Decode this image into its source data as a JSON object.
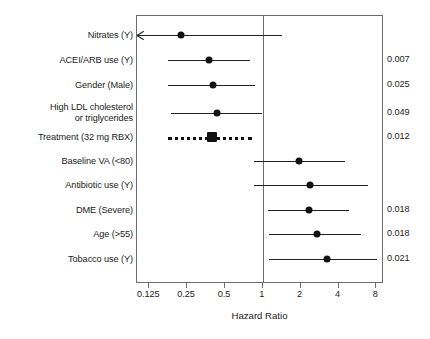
{
  "chart_data": {
    "type": "forest",
    "title": "",
    "xlabel": "Hazard Ratio",
    "ylabel": "",
    "xscale": "log2",
    "xlim": [
      0.1,
      9.2
    ],
    "reference_line": 1,
    "xticks": [
      0.125,
      0.25,
      0.5,
      1,
      2,
      4,
      8
    ],
    "xtick_labels": [
      "0.125",
      "0.25",
      "0.5",
      "1",
      "2",
      "4",
      "8"
    ],
    "pvalue_column_header": "",
    "grid": false,
    "legend": "none",
    "rows": [
      {
        "label": "Nitrates (Y)",
        "hr": 0.23,
        "ci_low": 0.1,
        "ci_high": 1.45,
        "ci_low_truncated": true,
        "marker": "circle",
        "linestyle": "solid",
        "pvalue": ""
      },
      {
        "label": "ACEI/ARB use (Y)",
        "hr": 0.38,
        "ci_low": 0.18,
        "ci_high": 0.8,
        "ci_low_truncated": false,
        "marker": "circle",
        "linestyle": "solid",
        "pvalue": "0.007"
      },
      {
        "label": "Gender (Male)",
        "hr": 0.41,
        "ci_low": 0.18,
        "ci_high": 0.88,
        "ci_low_truncated": false,
        "marker": "circle",
        "linestyle": "solid",
        "pvalue": "0.025"
      },
      {
        "label": "High LDL cholesterol\nor triglycerides",
        "hr": 0.44,
        "ci_low": 0.19,
        "ci_high": 1.0,
        "ci_low_truncated": false,
        "marker": "circle",
        "linestyle": "solid",
        "pvalue": "0.049"
      },
      {
        "label": "Treatment (32 mg RBX)",
        "hr": 0.4,
        "ci_low": 0.18,
        "ci_high": 0.83,
        "ci_low_truncated": false,
        "marker": "square",
        "linestyle": "dotted",
        "pvalue": "0.012"
      },
      {
        "label": "Baseline VA (<80)",
        "hr": 1.97,
        "ci_low": 0.87,
        "ci_high": 4.6,
        "ci_low_truncated": false,
        "marker": "circle",
        "linestyle": "solid",
        "pvalue": ""
      },
      {
        "label": "Antibiotic use (Y)",
        "hr": 2.4,
        "ci_low": 0.87,
        "ci_high": 7.0,
        "ci_low_truncated": false,
        "marker": "circle",
        "linestyle": "solid",
        "pvalue": ""
      },
      {
        "label": "DME (Severe)",
        "hr": 2.36,
        "ci_low": 1.13,
        "ci_high": 4.9,
        "ci_low_truncated": false,
        "marker": "circle",
        "linestyle": "solid",
        "pvalue": "0.018"
      },
      {
        "label": "Age (>55)",
        "hr": 2.77,
        "ci_low": 1.15,
        "ci_high": 6.2,
        "ci_low_truncated": false,
        "marker": "circle",
        "linestyle": "solid",
        "pvalue": "0.018"
      },
      {
        "label": "Tobacco use (Y)",
        "hr": 3.3,
        "ci_low": 1.15,
        "ci_high": 8.3,
        "ci_low_truncated": false,
        "marker": "circle",
        "linestyle": "solid",
        "pvalue": "0.021"
      }
    ]
  },
  "colors": {
    "marker": "#111111",
    "line": "#222222",
    "frame": "#6b6b6b",
    "text": "#1c1c1c",
    "background": "#ffffff"
  }
}
